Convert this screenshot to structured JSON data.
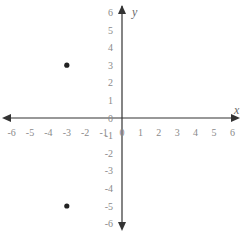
{
  "chart_data": {
    "type": "scatter",
    "title": "",
    "xlabel": "x",
    "ylabel": "y",
    "xlim": [
      -6,
      6
    ],
    "ylim": [
      -6,
      6
    ],
    "grid": false,
    "x_ticks": [
      -6,
      -5,
      -4,
      -3,
      -2,
      -1,
      0,
      1,
      2,
      3,
      4,
      5,
      6
    ],
    "y_ticks": [
      6,
      5,
      4,
      3,
      2,
      1,
      0,
      -1,
      -2,
      -3,
      -4,
      -5,
      -6
    ],
    "points": [
      {
        "x": -3,
        "y": 3
      },
      {
        "x": -3,
        "y": -5
      }
    ]
  },
  "colors": {
    "axis": "#333333",
    "point": "#222222",
    "tick_text": "#8a8a8a"
  }
}
